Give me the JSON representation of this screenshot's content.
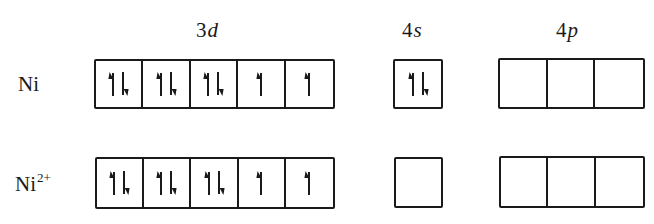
{
  "headers": {
    "d": {
      "num": "3",
      "letter": "d"
    },
    "s": {
      "num": "4",
      "letter": "s"
    },
    "p": {
      "num": "4",
      "letter": "p"
    }
  },
  "rows": [
    {
      "species": "Ni",
      "charge": "",
      "orbitals": {
        "3d": [
          "up-down",
          "up-down",
          "up-down",
          "up",
          "up"
        ],
        "4s": [
          "up-down"
        ],
        "4p": [
          "empty",
          "empty",
          "empty"
        ]
      }
    },
    {
      "species": "Ni",
      "charge": "2+",
      "orbitals": {
        "3d": [
          "up-down",
          "up-down",
          "up-down",
          "up",
          "up"
        ],
        "4s": [
          "empty"
        ],
        "4p": [
          "empty",
          "empty",
          "empty"
        ]
      }
    }
  ],
  "colors": {
    "ink": "#1a1a1a",
    "background": "#ffffff"
  }
}
